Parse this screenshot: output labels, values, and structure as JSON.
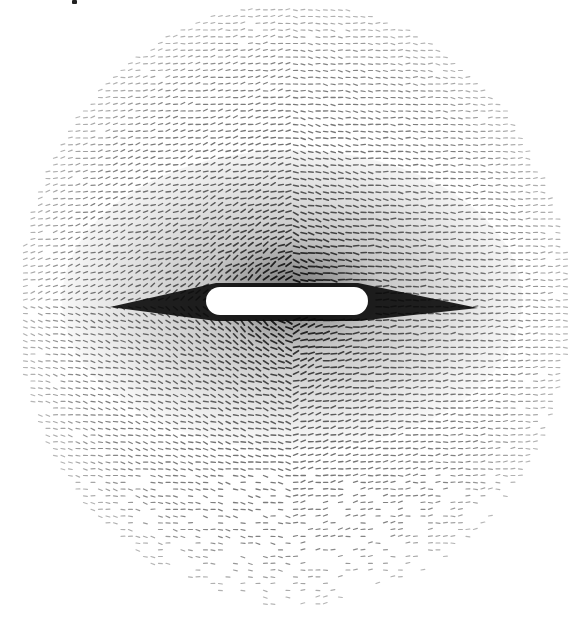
{
  "figure": {
    "background": "#ffffff",
    "ink_color": "#111111",
    "field": {
      "center_x": 292,
      "center_y": 305,
      "radius_x": 276,
      "radius_y": 302,
      "grid_spacing": 7.5,
      "arrow_length": 5
    },
    "body": {
      "shape": "rounded-rectangle",
      "fill": "#ffffff",
      "x": 206,
      "y": 287,
      "width": 162,
      "height": 28,
      "corner_radius": 14
    },
    "wake": {
      "left_tip_x": 110,
      "right_tip_x": 478,
      "y": 305,
      "color": "#0a0a0a"
    }
  }
}
